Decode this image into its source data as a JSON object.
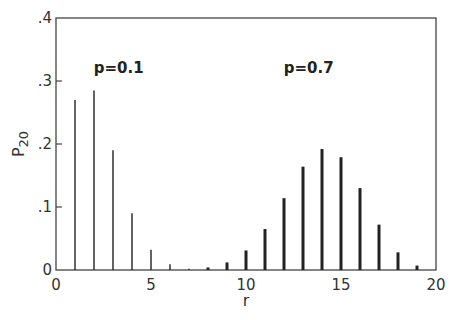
{
  "chart_data": {
    "type": "bar",
    "title": "",
    "xlabel": "r",
    "ylabel": "P20",
    "ylabel_main": "P",
    "ylabel_sub": "20",
    "xlim": [
      0,
      20
    ],
    "ylim": [
      0,
      0.4
    ],
    "xticks": [
      0,
      5,
      10,
      15,
      20
    ],
    "xtick_labels": [
      "0",
      "5",
      "10",
      "15",
      "20"
    ],
    "yticks": [
      0,
      0.1,
      0.2,
      0.3,
      0.4
    ],
    "ytick_labels": [
      "0",
      ".1",
      ".2",
      ".3",
      ".4"
    ],
    "grid": false,
    "legend": null,
    "annotations": [
      {
        "text": "p=0.1",
        "x": 3.3,
        "y": 0.32
      },
      {
        "text": "p=0.7",
        "x": 13.3,
        "y": 0.32
      }
    ],
    "series": [
      {
        "name": "p=0.1",
        "style": "thin",
        "x": [
          1,
          2,
          3,
          4,
          5,
          6,
          7
        ],
        "values": [
          0.27,
          0.285,
          0.19,
          0.09,
          0.032,
          0.009,
          0.002
        ]
      },
      {
        "name": "p=0.7",
        "style": "thick",
        "x": [
          8,
          9,
          10,
          11,
          12,
          13,
          14,
          15,
          16,
          17,
          18,
          19
        ],
        "values": [
          0.004,
          0.012,
          0.031,
          0.065,
          0.114,
          0.164,
          0.192,
          0.179,
          0.13,
          0.072,
          0.028,
          0.007
        ]
      }
    ]
  }
}
